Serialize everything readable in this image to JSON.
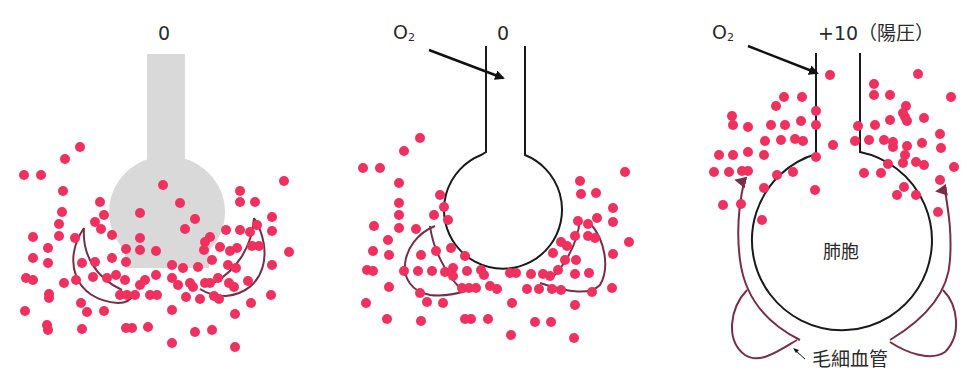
{
  "figure": {
    "panels": [
      {
        "id": "panel-1",
        "pressure_label": "0",
        "alveolus_state": "collapsed (filled, shaded)",
        "alveolus_fill": "#d9d9d9"
      },
      {
        "id": "panel-2",
        "pressure_label": "0",
        "o2_label": "O",
        "o2_sub": "2",
        "alveolus_state": "open, small"
      },
      {
        "id": "panel-3",
        "pressure_label": "+10（陽圧）",
        "o2_label": "O",
        "o2_sub": "2",
        "alveolus_label": "肺胞",
        "capillary_label": "毛細血管",
        "alveolus_state": "open, expanded"
      }
    ],
    "colors": {
      "dot": "#f0305f",
      "capillary": "#7a2d45",
      "outline": "#1a1a1a",
      "text": "#2a2a2a",
      "collapsed_fill": "#d9d9d9"
    }
  }
}
